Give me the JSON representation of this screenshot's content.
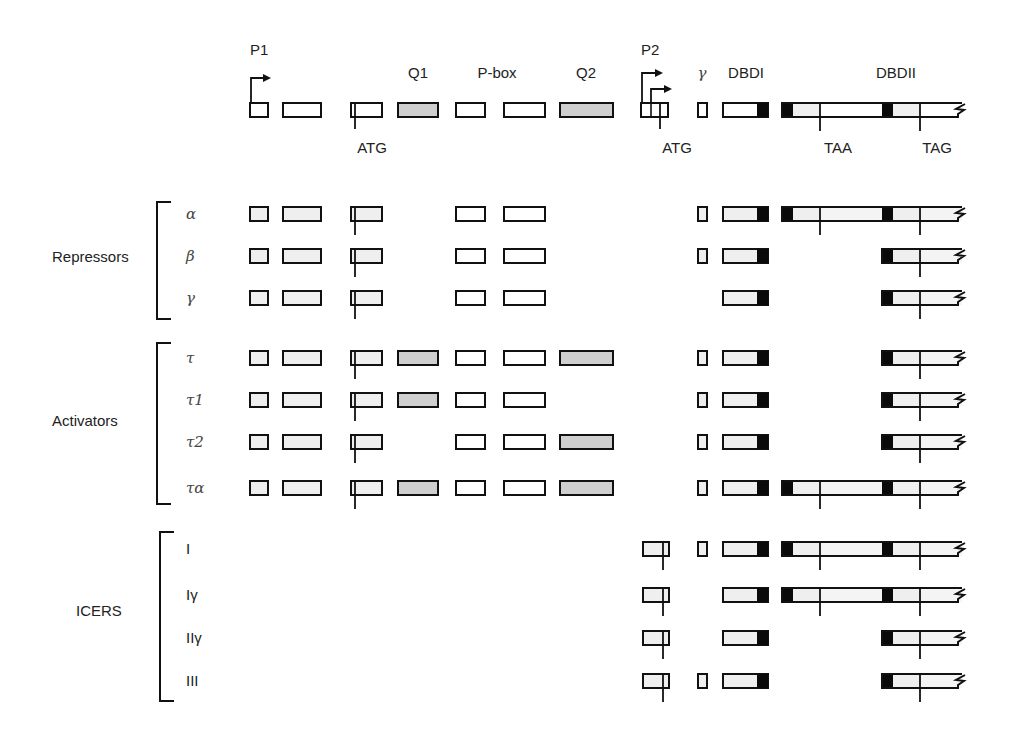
{
  "colors": {
    "stroke": "#111111",
    "white_fill": "#ffffff",
    "light_fill": "#efefef",
    "q_fill": "#cfcfcf",
    "black": "#0a0a0a"
  },
  "header": {
    "promoters": [
      {
        "label": "P1",
        "x": 250,
        "y": 55
      },
      {
        "label": "P2",
        "x": 641,
        "y": 55
      }
    ],
    "domain_labels": [
      {
        "label": "Q1",
        "x": 418,
        "y": 78,
        "italic": false
      },
      {
        "label": "P-box",
        "x": 497,
        "y": 78,
        "italic": false
      },
      {
        "label": "Q2",
        "x": 586,
        "y": 78,
        "italic": false
      },
      {
        "label": "γ",
        "x": 702,
        "y": 78,
        "italic": true
      },
      {
        "label": "DBDI",
        "x": 746,
        "y": 78,
        "italic": false
      },
      {
        "label": "DBDII",
        "x": 896,
        "y": 78,
        "italic": false
      }
    ],
    "codon_labels": [
      {
        "label": "ATG",
        "x": 372,
        "y": 153
      },
      {
        "label": "ATG",
        "x": 677,
        "y": 153
      },
      {
        "label": "TAA",
        "x": 838,
        "y": 153
      },
      {
        "label": "TAG",
        "x": 937,
        "y": 153
      }
    ]
  },
  "groups": [
    {
      "label": "Repressors",
      "label_x": 52,
      "label_y": 262,
      "bracket_x": 157,
      "y_top": 202,
      "y_bottom": 319
    },
    {
      "label": "Activators",
      "label_x": 52,
      "label_y": 426,
      "bracket_x": 157,
      "y_top": 343,
      "y_bottom": 504
    },
    {
      "label": "ICERS",
      "label_x": 76,
      "label_y": 616,
      "bracket_x": 160,
      "y_top": 532,
      "y_bottom": 701
    }
  ],
  "rows": [
    {
      "name": "header",
      "label": "",
      "y": 110,
      "exons": [
        "E1",
        "E2",
        "E3",
        "Q1",
        "PB",
        "E6",
        "Q2",
        "P2",
        "G",
        "DBDI",
        "DBDII_long"
      ],
      "white": true
    },
    {
      "name": "alpha",
      "label": "α",
      "greek": true,
      "y": 214,
      "exons": [
        "E1",
        "E2",
        "E3",
        "PB",
        "E6",
        "G",
        "DBDI",
        "DBDII_long"
      ]
    },
    {
      "name": "beta",
      "label": "β",
      "greek": true,
      "y": 256,
      "exons": [
        "E1",
        "E2",
        "E3",
        "PB",
        "E6",
        "G",
        "DBDI",
        "DBDII_short"
      ]
    },
    {
      "name": "gamma",
      "label": "γ",
      "greek": true,
      "y": 298,
      "exons": [
        "E1",
        "E2",
        "E3",
        "PB",
        "E6",
        "DBDI",
        "DBDII_short"
      ]
    },
    {
      "name": "tau",
      "label": "τ",
      "greek": true,
      "y": 358,
      "exons": [
        "E1",
        "E2",
        "E3",
        "Q1",
        "PB",
        "E6",
        "Q2",
        "G",
        "DBDI",
        "DBDII_short"
      ]
    },
    {
      "name": "tau1",
      "label": "τ1",
      "greek": true,
      "y": 400,
      "exons": [
        "E1",
        "E2",
        "E3",
        "Q1",
        "PB",
        "E6",
        "G",
        "DBDI",
        "DBDII_short"
      ]
    },
    {
      "name": "tau2",
      "label": "τ2",
      "greek": true,
      "y": 442,
      "exons": [
        "E1",
        "E2",
        "E3",
        "PB",
        "E6",
        "Q2",
        "G",
        "DBDI",
        "DBDII_short"
      ]
    },
    {
      "name": "tau-alpha",
      "label": "τα",
      "greek": true,
      "y": 488,
      "exons": [
        "E1",
        "E2",
        "E3",
        "Q1",
        "PB",
        "E6",
        "Q2",
        "G",
        "DBDI",
        "DBDII_long"
      ]
    },
    {
      "name": "icer-I",
      "label": "I",
      "greek": false,
      "y": 549,
      "exons": [
        "ICER",
        "G",
        "DBDI",
        "DBDII_long"
      ]
    },
    {
      "name": "icer-I-gamma",
      "label": "Iγ",
      "greek": false,
      "y": 595,
      "exons": [
        "ICER",
        "DBDI",
        "DBDII_long"
      ]
    },
    {
      "name": "icer-II-gamma",
      "label": "IIγ",
      "greek": false,
      "y": 638,
      "exons": [
        "ICER",
        "DBDI",
        "DBDII_short"
      ]
    },
    {
      "name": "icer-III",
      "label": "III",
      "greek": false,
      "y": 681,
      "exons": [
        "ICER",
        "G",
        "DBDI",
        "DBDII_short"
      ]
    }
  ],
  "exon_geometry": {
    "E1": {
      "x": 250,
      "w": 18,
      "kind": "plain"
    },
    "E2": {
      "x": 283,
      "w": 38,
      "kind": "plain"
    },
    "E3": {
      "x": 351,
      "w": 31,
      "kind": "atg",
      "atg_x": 355
    },
    "Q1": {
      "x": 398,
      "w": 40,
      "kind": "q"
    },
    "PB": {
      "x": 456,
      "w": 29,
      "kind": "plain"
    },
    "E6": {
      "x": 504,
      "w": 41,
      "kind": "plain"
    },
    "Q2": {
      "x": 560,
      "w": 53,
      "kind": "q"
    },
    "P2": {
      "x": 641,
      "w": 27,
      "kind": "p2"
    },
    "ICER": {
      "x": 643,
      "w": 26,
      "kind": "atg",
      "atg_x": 663
    },
    "G": {
      "x": 698,
      "w": 9,
      "kind": "plain"
    },
    "DBDI": {
      "x": 723,
      "w": 45,
      "kind": "dbdi",
      "black_w": 11
    },
    "DBDII_long": {
      "x": 782,
      "w": 180,
      "kind": "dbdii_long"
    },
    "DBDII_short": {
      "x": 882,
      "w": 80,
      "kind": "dbdii_short"
    }
  }
}
